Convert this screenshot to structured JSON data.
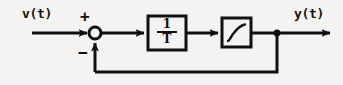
{
  "figure": {
    "kind": "control-block-diagram",
    "background_color": "#f4f3f1",
    "ink_color": "#101010"
  },
  "labels": {
    "input_signal": "v(t)",
    "output_signal": "y(t)",
    "sum_positive_sign": "+",
    "sum_negative_sign": "−"
  },
  "blocks": [
    {
      "id": "gain-block",
      "name": "integrator-gain-block",
      "numerator": "1",
      "denominator": "T",
      "expression": "1/T",
      "x": 148,
      "y": 16,
      "width": 38,
      "height": 34
    },
    {
      "id": "saturation-block",
      "name": "saturation-block",
      "icon": "sigmoid-saturation-curve",
      "expression": "saturation",
      "x": 222,
      "y": 18,
      "width": 29,
      "height": 29
    }
  ],
  "nodes": [
    {
      "id": "summing-junction",
      "name": "summing-junction",
      "shape": "open-circle",
      "cx": 95,
      "cy": 33,
      "r": 6
    },
    {
      "id": "takeoff-node",
      "name": "feedback-takeoff-node",
      "shape": "filled-dot",
      "cx": 277,
      "cy": 33,
      "r": 3
    }
  ],
  "signals": [
    {
      "id": "input-arrow",
      "name": "input-signal-arrow",
      "from": "v(t)",
      "to": "summing-junction",
      "direction": "right"
    },
    {
      "id": "error-line",
      "name": "error-signal-line",
      "from": "summing-junction",
      "to": "gain-block",
      "direction": "right"
    },
    {
      "id": "gain-out-line",
      "name": "gain-output-line",
      "from": "gain-block",
      "to": "saturation-block",
      "direction": "right"
    },
    {
      "id": "output-arrow",
      "name": "output-signal-arrow",
      "from": "saturation-block",
      "to": "y(t)",
      "direction": "right"
    },
    {
      "id": "feedback-path",
      "name": "feedback-path",
      "from": "takeoff-node",
      "to": "summing-junction",
      "direction": "up",
      "polarity": "negative"
    }
  ]
}
